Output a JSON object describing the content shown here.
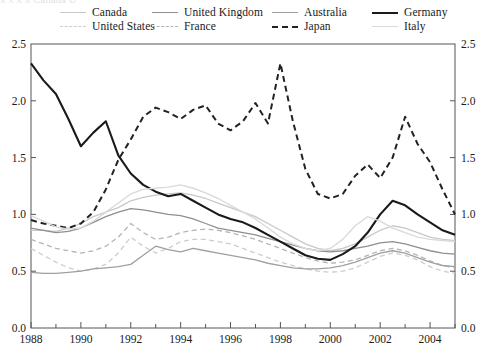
{
  "figure": {
    "background": "#ffffff",
    "frame_color": "#555555",
    "partial_top_text": "x x   x x   Canada   U"
  },
  "chart_data": {
    "type": "line",
    "title": "",
    "xlabel": "",
    "ylabel": "",
    "xlim": [
      1988,
      2005
    ],
    "ylim": [
      0.0,
      2.5
    ],
    "grid": false,
    "legend_position": "top",
    "legend_columns": 4,
    "y_ticks": [
      "0.0",
      "0.5",
      "1.0",
      "1.5",
      "2.0",
      "2.5"
    ],
    "y_tick_values": [
      0.0,
      0.5,
      1.0,
      1.5,
      2.0,
      2.5
    ],
    "y_axis_right_ticks": [
      "0.0",
      "0.5",
      "1.0",
      "1.5",
      "2.0",
      "2.5"
    ],
    "x_ticks": [
      "1988",
      "1990",
      "1992",
      "1994",
      "1996",
      "1998",
      "2000",
      "2002",
      "2004"
    ],
    "x_tick_values": [
      1988,
      1990,
      1992,
      1994,
      1996,
      1998,
      2000,
      2002,
      2004
    ],
    "x_minor_ticks": [
      1989,
      1991,
      1993,
      1995,
      1997,
      1999,
      2001,
      2003,
      2005
    ],
    "x": [
      1988,
      1988.5,
      1989,
      1989.5,
      1990,
      1990.5,
      1991,
      1991.5,
      1992,
      1992.5,
      1993,
      1993.5,
      1994,
      1994.5,
      1995,
      1995.5,
      1996,
      1996.5,
      1997,
      1997.5,
      1998,
      1998.5,
      1999,
      1999.5,
      2000,
      2000.5,
      2001,
      2001.5,
      2002,
      2002.5,
      2003,
      2003.5,
      2004,
      2004.5,
      2005
    ],
    "series": [
      {
        "name": "Canada",
        "color": "#c8c8c8",
        "style": "solid",
        "width": 1.3,
        "values": [
          0.86,
          0.86,
          0.85,
          0.88,
          0.92,
          0.98,
          1.02,
          1.06,
          1.12,
          1.15,
          1.17,
          1.18,
          1.19,
          1.17,
          1.14,
          1.1,
          1.06,
          1.02,
          0.98,
          0.92,
          0.86,
          0.8,
          0.74,
          0.7,
          0.68,
          0.7,
          0.74,
          0.8,
          0.86,
          0.9,
          0.88,
          0.84,
          0.8,
          0.78,
          0.77
        ]
      },
      {
        "name": "United States",
        "color": "#cdcdcd",
        "style": "dashed",
        "width": 1.3,
        "values": [
          0.7,
          0.64,
          0.58,
          0.53,
          0.5,
          0.52,
          0.56,
          0.66,
          0.8,
          0.72,
          0.66,
          0.7,
          0.76,
          0.78,
          0.78,
          0.76,
          0.74,
          0.7,
          0.66,
          0.62,
          0.58,
          0.55,
          0.52,
          0.5,
          0.49,
          0.5,
          0.53,
          0.58,
          0.63,
          0.66,
          0.64,
          0.6,
          0.54,
          0.5,
          0.48
        ]
      },
      {
        "name": "United Kingdom",
        "color": "#8f8f8f",
        "style": "solid",
        "width": 1.3,
        "values": [
          0.88,
          0.86,
          0.84,
          0.85,
          0.88,
          0.93,
          0.98,
          1.02,
          1.05,
          1.04,
          1.02,
          1.0,
          0.99,
          0.96,
          0.92,
          0.88,
          0.86,
          0.84,
          0.82,
          0.79,
          0.76,
          0.73,
          0.7,
          0.68,
          0.67,
          0.68,
          0.7,
          0.72,
          0.75,
          0.76,
          0.74,
          0.71,
          0.68,
          0.66,
          0.65
        ]
      },
      {
        "name": "France",
        "color": "#b4b4b4",
        "style": "dashed",
        "width": 1.3,
        "values": [
          0.78,
          0.74,
          0.7,
          0.68,
          0.66,
          0.68,
          0.72,
          0.8,
          0.92,
          0.84,
          0.78,
          0.8,
          0.84,
          0.86,
          0.87,
          0.86,
          0.84,
          0.81,
          0.78,
          0.74,
          0.7,
          0.66,
          0.62,
          0.59,
          0.57,
          0.58,
          0.6,
          0.64,
          0.68,
          0.7,
          0.68,
          0.64,
          0.59,
          0.55,
          0.53
        ]
      },
      {
        "name": "Australia",
        "color": "#a0a0a0",
        "style": "solid",
        "width": 1.3,
        "values": [
          0.49,
          0.48,
          0.48,
          0.49,
          0.5,
          0.52,
          0.53,
          0.54,
          0.56,
          0.64,
          0.72,
          0.69,
          0.67,
          0.7,
          0.68,
          0.66,
          0.64,
          0.62,
          0.6,
          0.57,
          0.55,
          0.53,
          0.52,
          0.52,
          0.53,
          0.55,
          0.58,
          0.62,
          0.66,
          0.68,
          0.66,
          0.62,
          0.58,
          0.55,
          0.54
        ]
      },
      {
        "name": "Germany",
        "color": "#1a1a1a",
        "style": "solid",
        "width": 2.1,
        "values": [
          2.33,
          2.18,
          2.06,
          1.84,
          1.6,
          1.72,
          1.82,
          1.52,
          1.36,
          1.26,
          1.2,
          1.16,
          1.18,
          1.12,
          1.06,
          1.0,
          0.96,
          0.93,
          0.88,
          0.82,
          0.76,
          0.7,
          0.64,
          0.61,
          0.6,
          0.65,
          0.72,
          0.84,
          1.0,
          1.12,
          1.08,
          1.0,
          0.93,
          0.86,
          0.82
        ]
      },
      {
        "name": "Japan",
        "color": "#222222",
        "style": "dashed",
        "width": 2.0,
        "values": [
          0.95,
          0.92,
          0.9,
          0.88,
          0.92,
          1.02,
          1.22,
          1.48,
          1.66,
          1.86,
          1.94,
          1.9,
          1.84,
          1.92,
          1.96,
          1.8,
          1.74,
          1.82,
          1.98,
          1.8,
          2.33,
          1.82,
          1.4,
          1.18,
          1.14,
          1.18,
          1.34,
          1.44,
          1.32,
          1.5,
          1.86,
          1.62,
          1.46,
          1.22,
          1.0
        ]
      },
      {
        "name": "Italy",
        "color": "#dadada",
        "style": "solid",
        "width": 1.4,
        "values": [
          0.99,
          0.94,
          0.89,
          0.87,
          0.88,
          0.94,
          1.02,
          1.1,
          1.18,
          1.22,
          1.23,
          1.24,
          1.26,
          1.23,
          1.19,
          1.14,
          1.08,
          1.02,
          0.96,
          0.88,
          0.8,
          0.74,
          0.7,
          0.68,
          0.7,
          0.78,
          0.9,
          0.98,
          0.94,
          0.88,
          0.84,
          0.8,
          0.78,
          0.77,
          0.76
        ]
      }
    ],
    "legend_entries": [
      {
        "label": "Canada",
        "style": "solid",
        "color": "#c8c8c8",
        "width": 1.4,
        "row": 0,
        "col": 0
      },
      {
        "label": "United States",
        "style": "dashed",
        "color": "#cdcdcd",
        "width": 1.4,
        "row": 1,
        "col": 0
      },
      {
        "label": "United Kingdom",
        "style": "solid",
        "color": "#8f8f8f",
        "width": 1.4,
        "row": 0,
        "col": 1
      },
      {
        "label": "France",
        "style": "dashed",
        "color": "#b4b4b4",
        "width": 1.4,
        "row": 1,
        "col": 1
      },
      {
        "label": "Australia",
        "style": "solid",
        "color": "#a0a0a0",
        "width": 1.4,
        "row": 0,
        "col": 2
      },
      {
        "label": "Japan",
        "style": "dashed",
        "color": "#222222",
        "width": 2.0,
        "row": 1,
        "col": 2
      },
      {
        "label": "Germany",
        "style": "solid",
        "color": "#1a1a1a",
        "width": 2.2,
        "row": 0,
        "col": 3
      },
      {
        "label": "Italy",
        "style": "solid",
        "color": "#dadada",
        "width": 1.4,
        "row": 1,
        "col": 3
      }
    ]
  }
}
